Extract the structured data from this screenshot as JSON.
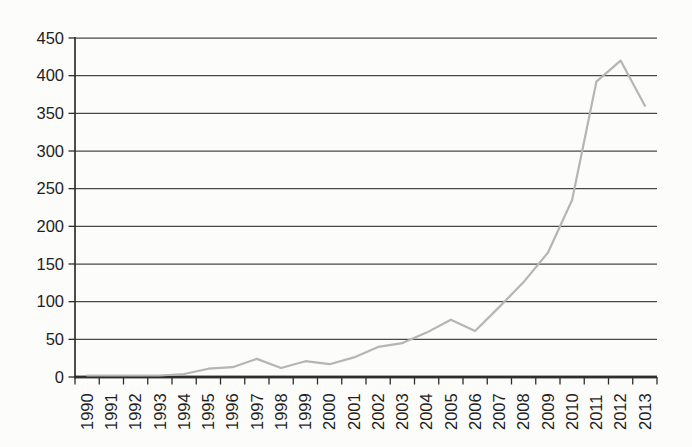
{
  "chart_data": {
    "type": "line",
    "title": "",
    "xlabel": "",
    "ylabel": "",
    "categories": [
      "1990",
      "1991",
      "1992",
      "1993",
      "1994",
      "1995",
      "1996",
      "1997",
      "1998",
      "1999",
      "2000",
      "2001",
      "2002",
      "2003",
      "2004",
      "2005",
      "2006",
      "2007",
      "2008",
      "2009",
      "2010",
      "2011",
      "2012",
      "2013"
    ],
    "values": [
      2,
      2,
      2,
      2,
      4,
      11,
      13,
      24,
      12,
      21,
      17,
      26,
      40,
      45,
      59,
      76,
      61,
      93,
      126,
      165,
      235,
      392,
      420,
      360
    ],
    "ylim": [
      0,
      450
    ],
    "ytick_step": 50,
    "y_tick_labels": [
      "0",
      "50",
      "100",
      "150",
      "200",
      "250",
      "300",
      "350",
      "400",
      "450"
    ],
    "grid": true,
    "legend_position": "none",
    "line_style": "solid",
    "marker": "none",
    "colors": {
      "line": "#b5b5b5",
      "grid": "#484848",
      "axis": "#2e2e2e",
      "text": "#1f1f1f",
      "background": "#fcfcfa"
    }
  }
}
